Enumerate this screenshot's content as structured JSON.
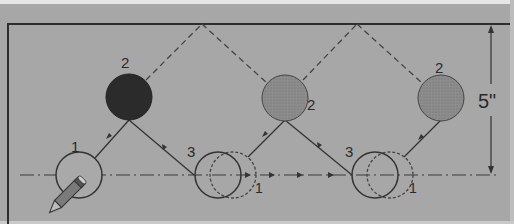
{
  "diagram": {
    "type": "billiard-cushion-shot-diagram",
    "dimension_label": "5\"",
    "positions": [
      {
        "id": "cue-start",
        "label": "1",
        "x": 79,
        "y": 175,
        "fill": "none"
      },
      {
        "id": "object-ball-a",
        "label": "2",
        "x": 129,
        "y": 98,
        "fill": "#2b2b2b"
      },
      {
        "id": "landing-a",
        "label": "3",
        "x": 218,
        "y": 175,
        "fill": "none",
        "ghost_label": "1"
      },
      {
        "id": "object-ball-b",
        "label": "2",
        "x": 285,
        "y": 98,
        "fill": "#8a8a8a"
      },
      {
        "id": "landing-b",
        "label": "3",
        "x": 376,
        "y": 175,
        "fill": "none",
        "ghost_label": "1"
      },
      {
        "id": "object-ball-c",
        "label": "2",
        "x": 441,
        "y": 98,
        "fill": "#8a8a8a"
      }
    ],
    "labels": {
      "cue_start": "1",
      "ball_a": "2",
      "landing_a": "3",
      "ghost_a": "1",
      "ball_b": "2",
      "landing_b": "3",
      "ghost_b": "1",
      "ball_c": "2",
      "dimension": "5\""
    },
    "rail_contacts": [
      {
        "x": 202,
        "y": 24
      },
      {
        "x": 357,
        "y": 24
      }
    ],
    "colors": {
      "background": "#a7a7a7",
      "ink": "#333333",
      "dark_ball": "#2b2b2b",
      "grey_ball": "#8a8a8a"
    }
  }
}
